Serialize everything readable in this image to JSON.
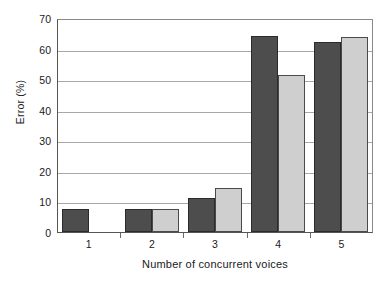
{
  "chart_data": {
    "type": "bar",
    "title": "",
    "subtitle": "",
    "xlabel": "Number of concurrent voices",
    "ylabel": "Error (%)",
    "categories": [
      "1",
      "2",
      "3",
      "4",
      "5"
    ],
    "ylim": [
      0,
      70
    ],
    "yticks": [
      0,
      10,
      20,
      30,
      40,
      50,
      60,
      70
    ],
    "ytick_labels": [
      "0",
      "10",
      "20",
      "30",
      "40",
      "50",
      "60",
      "70"
    ],
    "grid": true,
    "grid_axis": "y",
    "legend": false,
    "legend_position": "none",
    "series": [
      {
        "name": "dark",
        "color": "#4d4d4d",
        "values": [
          7.6,
          7.5,
          11.0,
          64.2,
          62.0
        ]
      },
      {
        "name": "light",
        "color": "#cfcfcf",
        "values": [
          null,
          7.5,
          14.4,
          51.5,
          63.7
        ]
      }
    ]
  },
  "axes": {
    "y_title": "Error (%)",
    "x_title": "Number of concurrent voices"
  },
  "colors": {
    "series_dark": "#4d4d4d",
    "series_light": "#cfcfcf",
    "bar_outline": "#2b2b2b",
    "gridline": "#a8a8a8",
    "axis": "#555555",
    "background": "#ffffff",
    "text": "#1a1a1a"
  }
}
